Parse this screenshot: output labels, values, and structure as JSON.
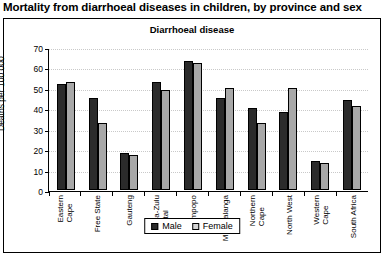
{
  "page": {
    "heading": "Mortality from diarrhoeal diseases in children, by province and sex"
  },
  "chart_data": {
    "type": "bar",
    "title": "Diarrhoeal disease",
    "xlabel": "",
    "ylabel": "Deaths per 100 000",
    "ylim": [
      0,
      70
    ],
    "yticks": [
      0,
      10,
      20,
      30,
      40,
      50,
      60,
      70
    ],
    "grid": true,
    "legend_position": "bottom",
    "categories": [
      "Eastern Cape",
      "Free State",
      "Gauteng",
      "Kwa-Zulu Natal",
      "Limpopo",
      "Mpumalanga",
      "Northern Cape",
      "North West",
      "Western Cape",
      "South Africa"
    ],
    "categories_lines": [
      [
        "Eastern",
        "Cape"
      ],
      [
        "Free State"
      ],
      [
        "Gauteng"
      ],
      [
        "Kwa-Zulu",
        "Natal"
      ],
      [
        "Limpopo"
      ],
      [
        "Mpumalanga"
      ],
      [
        "Northern",
        "Cape"
      ],
      [
        "North West"
      ],
      [
        "Western",
        "Cape"
      ],
      [
        "South Africa"
      ]
    ],
    "series": [
      {
        "name": "Male",
        "color": "#2b2b2b",
        "values": [
          52,
          45,
          18,
          53,
          63,
          45,
          40,
          38,
          14,
          44
        ]
      },
      {
        "name": "Female",
        "color": "#a8a8a8",
        "values": [
          53,
          33,
          17,
          49,
          62,
          50,
          33,
          50,
          13,
          41
        ]
      }
    ]
  }
}
